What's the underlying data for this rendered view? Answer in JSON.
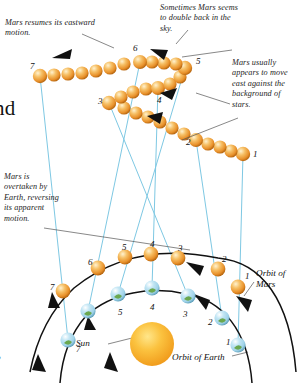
{
  "diagram": {
    "captions": {
      "resumes": "Mars resumes its eastward motion.",
      "double_back": "Sometimes Mars seems to double back in the sky.",
      "usually_east": "Mars usually appears to move east against the background of stars.",
      "overtaken": "Mars is overtaken by Earth, reversing its apparent motion.",
      "edge_cut_top": "nd",
      "edge_cut_bottom": "o"
    },
    "labels": {
      "sun": "Sun",
      "orbit_of_mars": "Orbit of Mars",
      "orbit_of_earth": "Orbit of Earth"
    },
    "colors": {
      "mars": "#e8902a",
      "mars_highlight": "#fbdca0",
      "earth": "#9fd2e8",
      "earth_land": "#6aa84f",
      "sun": "#f5a623",
      "sun_core": "#ffd24d",
      "sightline": "#7ec8e3",
      "orbit_line": "#1a1a1a",
      "leader_line": "#555555",
      "background": "#ffffff"
    },
    "sky_track": {
      "description": "Apparent path of Mars against background stars, positions 1-7",
      "labeled_numbers": [
        "1",
        "2",
        "3",
        "4",
        "5",
        "6",
        "7"
      ],
      "positions": [
        {
          "label": "1",
          "x": 243,
          "y": 154,
          "num_x": 253,
          "num_y": 150
        },
        {
          "label": "2",
          "x": 196,
          "y": 140,
          "num_x": 186,
          "num_y": 138
        },
        {
          "label": "3",
          "x": 109,
          "y": 103,
          "num_x": 98,
          "num_y": 97
        },
        {
          "label": "4",
          "x": 158,
          "y": 88,
          "num_x": 157,
          "num_y": 96
        },
        {
          "label": "5",
          "x": 185,
          "y": 68,
          "num_x": 196,
          "num_y": 57
        },
        {
          "label": "6",
          "x": 140,
          "y": 62,
          "num_x": 133,
          "num_y": 44
        },
        {
          "label": "7",
          "x": 40,
          "y": 76,
          "num_x": 30,
          "num_y": 62
        }
      ]
    },
    "mars_orbit": {
      "description": "Mars orbital positions 1-7 on outer arc",
      "positions": [
        {
          "label": "1",
          "x": 238,
          "y": 287,
          "num_x": 245,
          "num_y": 272
        },
        {
          "label": "2",
          "x": 218,
          "y": 269,
          "num_x": 222,
          "num_y": 255
        },
        {
          "label": "3",
          "x": 178,
          "y": 258,
          "num_x": 178,
          "num_y": 244
        },
        {
          "label": "4",
          "x": 151,
          "y": 254,
          "num_x": 150,
          "num_y": 240
        },
        {
          "label": "5",
          "x": 125,
          "y": 257,
          "num_x": 122,
          "num_y": 243
        },
        {
          "label": "6",
          "x": 98,
          "y": 268,
          "num_x": 88,
          "num_y": 258
        },
        {
          "label": "7",
          "x": 63,
          "y": 291,
          "num_x": 50,
          "num_y": 283
        }
      ]
    },
    "earth_orbit": {
      "description": "Earth orbital positions 1-7 on inner arc",
      "positions": [
        {
          "label": "1",
          "x": 238,
          "y": 345,
          "num_x": 226,
          "num_y": 338
        },
        {
          "label": "2",
          "x": 222,
          "y": 318,
          "num_x": 208,
          "num_y": 318
        },
        {
          "label": "3",
          "x": 188,
          "y": 296,
          "num_x": 183,
          "num_y": 310
        },
        {
          "label": "4",
          "x": 152,
          "y": 288,
          "num_x": 150,
          "num_y": 303
        },
        {
          "label": "5",
          "x": 118,
          "y": 294,
          "num_x": 118,
          "num_y": 308
        },
        {
          "label": "6",
          "x": 88,
          "y": 311,
          "num_x": 86,
          "num_y": 322
        },
        {
          "label": "7",
          "x": 68,
          "y": 340,
          "num_x": 76,
          "num_y": 345
        }
      ]
    },
    "sun": {
      "x": 152,
      "y": 344,
      "radius": 22
    }
  }
}
